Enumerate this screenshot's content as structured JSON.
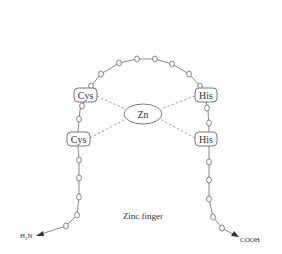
{
  "diagram": {
    "title": "Zinc finger",
    "metal": {
      "label": "Zn",
      "cx": 143,
      "cy": 114,
      "rx": 19,
      "ry": 10
    },
    "residues": [
      {
        "id": "cys1",
        "label": "Cys",
        "x": 74,
        "y": 88,
        "w": 23,
        "h": 14
      },
      {
        "id": "cys2",
        "label": "Cys",
        "x": 67,
        "y": 132,
        "w": 23,
        "h": 14
      },
      {
        "id": "his1",
        "label": "His",
        "x": 195,
        "y": 88,
        "w": 22,
        "h": 14
      },
      {
        "id": "his2",
        "label": "His",
        "x": 195,
        "y": 132,
        "w": 22,
        "h": 14
      }
    ],
    "termini": {
      "n_terminus": {
        "label_main": "H",
        "label_sub": "2",
        "label_tail": "N",
        "x": 20,
        "y": 236
      },
      "c_terminus": {
        "label": "COOH",
        "x": 240,
        "y": 241
      }
    },
    "colors": {
      "line": "#555555",
      "text": "#333333",
      "dash": "#777777"
    }
  }
}
